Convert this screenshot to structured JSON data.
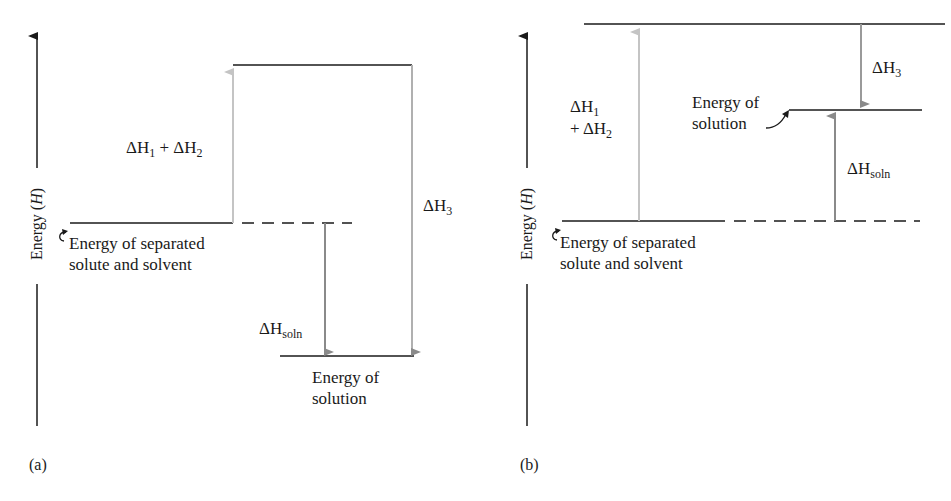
{
  "colors": {
    "level_line": "#1a1a1a",
    "arrow_light": "#c4c4c4",
    "arrow_mid": "#8a8a8a",
    "text": "#1a1a1a"
  },
  "panel_a": {
    "tag": "(a)",
    "axis_label": "Energy (H)",
    "axis_word": "Energy",
    "axis_symbol": "H",
    "levels": {
      "separated": "Energy of separated",
      "separated_2": "solute and solvent",
      "solution": "Energy of",
      "solution_2": "solution"
    },
    "arrows": {
      "dh12": {
        "delta": "ΔH",
        "sub1": "1",
        "plus": " + ΔH",
        "sub2": "2"
      },
      "dh3": {
        "delta": "ΔH",
        "sub": "3"
      },
      "dhsoln": {
        "delta": "ΔH",
        "sub": "soln"
      }
    }
  },
  "panel_b": {
    "tag": "(b)",
    "axis_label": "Energy (H)",
    "axis_word": "Energy",
    "axis_symbol": "H",
    "levels": {
      "separated": "Energy of separated",
      "separated_2": "solute and solvent",
      "solution": "Energy of",
      "solution_2": "solution"
    },
    "arrows": {
      "dh1": {
        "delta": "ΔH",
        "sub": "1"
      },
      "dh2": {
        "plus": "+ ΔH",
        "sub": "2"
      },
      "dh3": {
        "delta": "ΔH",
        "sub": "3"
      },
      "dhsoln": {
        "delta": "ΔH",
        "sub": "soln"
      }
    }
  }
}
